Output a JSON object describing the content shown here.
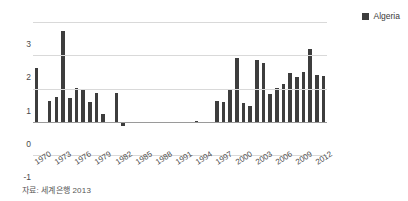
{
  "chart_data": {
    "type": "bar",
    "title": "",
    "xlabel": "",
    "ylabel": "",
    "ylim": [
      -1,
      3
    ],
    "yticks": [
      -1,
      0,
      1,
      2,
      3
    ],
    "grid": true,
    "legend_position": "top-right",
    "series": [
      {
        "name": "Algeria",
        "color": "#3d3d3d",
        "values": [
          1.62,
          0.0,
          0.62,
          0.73,
          2.72,
          0.72,
          1.03,
          0.95,
          0.58,
          0.86,
          0.22,
          0.0,
          0.85,
          -0.12,
          0.0,
          0.0,
          0.0,
          0.0,
          0.0,
          0.0,
          0.0,
          0.0,
          0.0,
          0.0,
          0.03,
          0.0,
          0.0,
          0.62,
          0.58,
          0.97,
          1.93,
          0.55,
          0.47,
          1.87,
          1.76,
          0.82,
          1.02,
          1.15,
          1.47,
          1.35,
          1.5,
          2.18,
          1.4,
          1.38
        ]
      }
    ],
    "categories": [
      1970,
      1971,
      1972,
      1973,
      1974,
      1975,
      1976,
      1977,
      1978,
      1979,
      1980,
      1981,
      1982,
      1983,
      1984,
      1985,
      1986,
      1987,
      1988,
      1989,
      1990,
      1991,
      1992,
      1993,
      1994,
      1995,
      1996,
      1997,
      1998,
      1999,
      2000,
      2001,
      2002,
      2003,
      2004,
      2005,
      2006,
      2007,
      2008,
      2009,
      2010,
      2011,
      2012,
      2013
    ],
    "xtick_labels": [
      "1970",
      "1973",
      "1976",
      "1979",
      "1982",
      "1985",
      "1988",
      "1991",
      "1994",
      "1997",
      "2000",
      "2003",
      "2006",
      "2009",
      "2012"
    ],
    "xtick_indices": [
      0,
      3,
      6,
      9,
      12,
      15,
      18,
      21,
      24,
      27,
      30,
      33,
      36,
      39,
      42
    ]
  },
  "legend": {
    "entries": [
      {
        "label": "Algeria",
        "color": "#3d3d3d",
        "marker": "square"
      }
    ]
  },
  "caption": {
    "text": "자료: 세계은행 2013"
  }
}
